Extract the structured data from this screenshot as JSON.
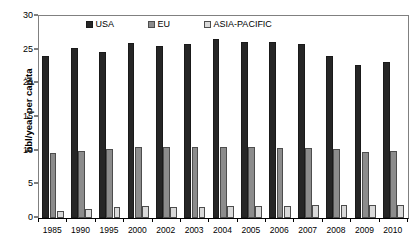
{
  "chart_data": {
    "type": "bar",
    "title": "",
    "xlabel": "",
    "ylabel": "bbl/year per capita",
    "ylim": [
      0,
      30
    ],
    "yticks": [
      0,
      5,
      10,
      15,
      20,
      25,
      30
    ],
    "grid": false,
    "legend_position": "top-center-inside",
    "categories": [
      "1985",
      "1990",
      "1995",
      "2000",
      "2002",
      "2003",
      "2004",
      "2005",
      "2006",
      "2007",
      "2008",
      "2009",
      "2010"
    ],
    "series": [
      {
        "name": "USA",
        "color": "#262626",
        "values": [
          24.1,
          25.3,
          24.7,
          26.0,
          25.6,
          25.8,
          26.6,
          26.2,
          26.1,
          25.8,
          24.0,
          22.7,
          23.1
        ]
      },
      {
        "name": "EU",
        "color": "#8c8c8c",
        "values": [
          9.6,
          10.0,
          10.3,
          10.5,
          10.5,
          10.5,
          10.6,
          10.5,
          10.4,
          10.4,
          10.2,
          9.8,
          10.0
        ]
      },
      {
        "name": "ASIA-PACIFIC",
        "color": "#d9d9d9",
        "values": [
          1.1,
          1.4,
          1.6,
          1.8,
          1.7,
          1.7,
          1.8,
          1.8,
          1.85,
          1.9,
          1.9,
          1.9,
          2.0
        ]
      }
    ]
  }
}
